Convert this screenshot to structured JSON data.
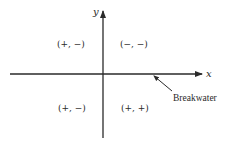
{
  "diagram": {
    "axes": {
      "x_label": "x",
      "y_label": "y"
    },
    "quadrants": {
      "upper_left": "(+, −)",
      "upper_right": "(−, −)",
      "lower_left": "(+, −)",
      "lower_right": "(+, +)"
    },
    "annotation": {
      "label": "Breakwater"
    },
    "colors": {
      "ink": "#2a2a2a",
      "background": "#ffffff"
    }
  }
}
